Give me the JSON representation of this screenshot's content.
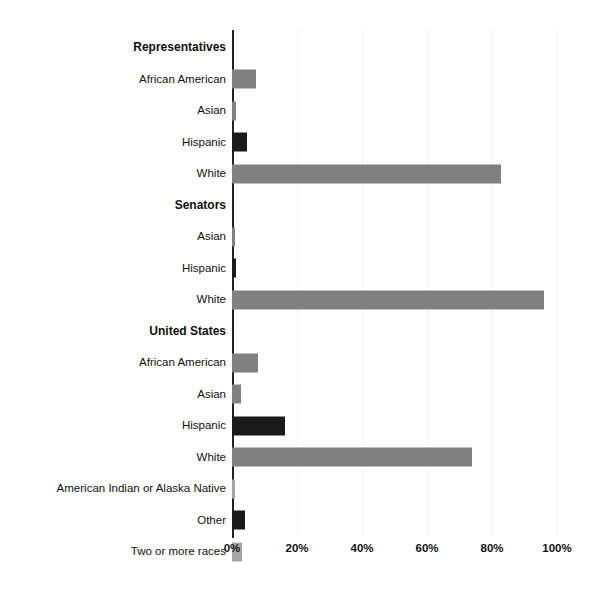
{
  "chart_data": {
    "type": "bar",
    "orientation": "horizontal",
    "title": "",
    "xlabel": "",
    "ylabel": "",
    "xlim": [
      0,
      100
    ],
    "xticks": [
      "0%",
      "20%",
      "40%",
      "60%",
      "80%",
      "100%"
    ],
    "xtick_values": [
      0,
      20,
      40,
      60,
      80,
      100
    ],
    "grid": true,
    "legend": "none",
    "value_unit": "%",
    "colors": {
      "gray": "#808080",
      "dark": "#1a1a1a",
      "light": "#a6a6a6",
      "axis": "#222222",
      "grid": "#e9e9ec",
      "background": "#ffffff",
      "text": "#111111"
    },
    "groups": [
      {
        "name": "Representatives",
        "categories": [
          "African American",
          "Asian",
          "Hispanic",
          "White"
        ],
        "values": [
          7.4,
          1.2,
          4.6,
          82.8
        ],
        "bar_colors": [
          "gray",
          "gray",
          "dark",
          "gray"
        ]
      },
      {
        "name": "Senators",
        "categories": [
          "Asian",
          "Hispanic",
          "White"
        ],
        "values": [
          1.0,
          1.2,
          96.0
        ],
        "bar_colors": [
          "gray",
          "dark",
          "gray"
        ]
      },
      {
        "name": "United States",
        "categories": [
          "African American",
          "Asian",
          "Hispanic",
          "White",
          "American Indian or Alaska Native",
          "Other",
          "Two or more races"
        ],
        "values": [
          8.0,
          2.8,
          16.3,
          73.8,
          0.9,
          4.0,
          3.0
        ],
        "bar_colors": [
          "gray",
          "gray",
          "dark",
          "gray",
          "light",
          "dark",
          "light"
        ]
      }
    ]
  },
  "rows": [
    {
      "label": "Representatives",
      "kind": "group",
      "value": null,
      "color": null
    },
    {
      "label": "African American",
      "kind": "item",
      "value": 7.4,
      "color": "gray"
    },
    {
      "label": "Asian",
      "kind": "item",
      "value": 1.2,
      "color": "gray"
    },
    {
      "label": "Hispanic",
      "kind": "item",
      "value": 4.6,
      "color": "dark"
    },
    {
      "label": "White",
      "kind": "item",
      "value": 82.8,
      "color": "gray"
    },
    {
      "label": "Senators",
      "kind": "group",
      "value": null,
      "color": null
    },
    {
      "label": "Asian",
      "kind": "item",
      "value": 1.0,
      "color": "gray"
    },
    {
      "label": "Hispanic",
      "kind": "item",
      "value": 1.2,
      "color": "dark"
    },
    {
      "label": "White",
      "kind": "item",
      "value": 96.0,
      "color": "gray"
    },
    {
      "label": "United States",
      "kind": "group",
      "value": null,
      "color": null
    },
    {
      "label": "African American",
      "kind": "item",
      "value": 8.0,
      "color": "gray"
    },
    {
      "label": "Asian",
      "kind": "item",
      "value": 2.8,
      "color": "gray"
    },
    {
      "label": "Hispanic",
      "kind": "item",
      "value": 16.3,
      "color": "dark"
    },
    {
      "label": "White",
      "kind": "item",
      "value": 73.8,
      "color": "gray"
    },
    {
      "label": "American Indian or Alaska Native",
      "kind": "item",
      "value": 0.9,
      "color": "light"
    },
    {
      "label": "Other",
      "kind": "item",
      "value": 4.0,
      "color": "dark"
    },
    {
      "label": "Two or more races",
      "kind": "item",
      "value": 3.0,
      "color": "light"
    }
  ]
}
